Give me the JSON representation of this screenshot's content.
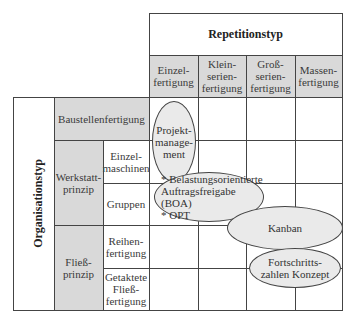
{
  "header": {
    "title": "Repetitionstyp",
    "columns": [
      {
        "label": "Einzel-\nfertigung"
      },
      {
        "label": "Klein-\nserien-\nfertigung"
      },
      {
        "label": "Groß-\nserien-\nfertigung"
      },
      {
        "label": "Massen-\nfertigung"
      }
    ]
  },
  "side": {
    "title": "Organisationstyp",
    "groups": [
      {
        "label": "Baustellenfertigung"
      },
      {
        "label": "Werkstatt-\nprinzip",
        "rows": [
          {
            "label": "Einzel-\nmaschinen"
          },
          {
            "label": "Gruppen"
          }
        ]
      },
      {
        "label": "Fließ-\nprinzip",
        "rows": [
          {
            "label": "Reihen-\nfertigung"
          },
          {
            "label": "Getaktete\nFließ-\nfertigung"
          }
        ]
      }
    ]
  },
  "ellipses": [
    {
      "label": "Projekt-\nmanage-\nment"
    },
    {
      "label": "* Belastungsorientierte\nAuftragsfreigabe (BOA)\n* OPT"
    },
    {
      "label": "Kanban"
    },
    {
      "label": "Fortschritts-\nzahlen Konzept"
    }
  ],
  "colors": {
    "header_fill": "#d9d9d9",
    "ellipse_fill": "#eaeaea",
    "line": "#444444"
  }
}
